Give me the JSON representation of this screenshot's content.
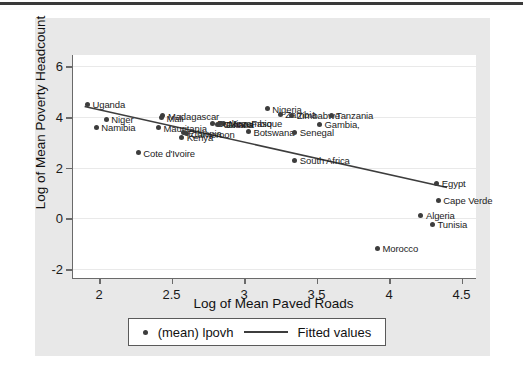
{
  "chart_data": {
    "type": "scatter",
    "title": "",
    "xlabel": "Log of Mean Paved Roads",
    "ylabel": "Log of Mean Poverty Headcount",
    "xlim": [
      1.82,
      4.6
    ],
    "ylim": [
      -2.35,
      6.45
    ],
    "xticks": [
      "2",
      "2.5",
      "3",
      "3.5",
      "4",
      "4.5"
    ],
    "xtick_values": [
      2,
      2.5,
      3,
      3.5,
      4,
      4.5
    ],
    "yticks": [
      "6",
      "4",
      "2",
      "0",
      "-2"
    ],
    "ytick_values": [
      6,
      4,
      2,
      0,
      -2
    ],
    "grid": "horizontal",
    "legend_position": "below-axis",
    "legend": [
      {
        "marker": "dot",
        "label": "(mean) lpovh"
      },
      {
        "marker": "line",
        "label": "Fitted values"
      }
    ],
    "series": [
      {
        "name": "(mean) lpovh",
        "points": [
          {
            "label": "Uganda",
            "x": 1.92,
            "y": 4.5,
            "label_side": "right"
          },
          {
            "label": "Niger",
            "x": 2.05,
            "y": 3.92,
            "label_side": "right"
          },
          {
            "label": "Namibia",
            "x": 1.98,
            "y": 3.6,
            "label_side": "right"
          },
          {
            "label": "Cote d'Ivoire",
            "x": 2.27,
            "y": 2.6,
            "label_side": "right"
          },
          {
            "label": "Madagascar",
            "x": 2.44,
            "y": 4.05,
            "label_side": "right"
          },
          {
            "label": "Mali",
            "x": 2.43,
            "y": 3.98,
            "label_side": "right"
          },
          {
            "label": "Mauritania",
            "x": 2.41,
            "y": 3.58,
            "label_side": "right"
          },
          {
            "label": "Ethiopia",
            "x": 2.58,
            "y": 3.38,
            "label_side": "right"
          },
          {
            "label": "Cameroon",
            "x": 2.6,
            "y": 3.34,
            "label_side": "right"
          },
          {
            "label": "Kenya",
            "x": 2.57,
            "y": 3.2,
            "label_side": "right"
          },
          {
            "label": "Burkina Faso",
            "x": 2.78,
            "y": 3.75,
            "label_side": "right"
          },
          {
            "label": "Mozambique",
            "x": 2.86,
            "y": 3.76,
            "label_side": "right"
          },
          {
            "label": "Ghana",
            "x": 2.84,
            "y": 3.74,
            "label_side": "right"
          },
          {
            "label": "Guinea",
            "x": 2.82,
            "y": 3.72,
            "label_side": "right"
          },
          {
            "label": "Botswana",
            "x": 3.03,
            "y": 3.42,
            "label_side": "right"
          },
          {
            "label": "Nigeria",
            "x": 3.16,
            "y": 4.32,
            "label_side": "right"
          },
          {
            "label": "Zambia",
            "x": 3.25,
            "y": 4.12,
            "label_side": "right"
          },
          {
            "label": "Zimbabwe",
            "x": 3.33,
            "y": 4.08,
            "label_side": "right"
          },
          {
            "label": "Senegal",
            "x": 3.35,
            "y": 3.4,
            "label_side": "right"
          },
          {
            "label": "Tanzania",
            "x": 3.6,
            "y": 4.08,
            "label_side": "right"
          },
          {
            "label": "Gambia,",
            "x": 3.52,
            "y": 3.72,
            "label_side": "right"
          },
          {
            "label": "South Africa",
            "x": 3.35,
            "y": 2.3,
            "label_side": "right"
          },
          {
            "label": "Morocco",
            "x": 3.92,
            "y": -1.18,
            "label_side": "right"
          },
          {
            "label": "Algeria",
            "x": 4.22,
            "y": 0.12,
            "label_side": "right"
          },
          {
            "label": "Tunisia",
            "x": 4.3,
            "y": -0.22,
            "label_side": "right"
          },
          {
            "label": "Egypt",
            "x": 4.33,
            "y": 1.38,
            "label_side": "right"
          },
          {
            "label": "Cape Verde",
            "x": 4.34,
            "y": 0.72,
            "label_side": "right"
          }
        ]
      }
    ],
    "fit_line": {
      "name": "Fitted values",
      "x1": 1.9,
      "y1": 4.42,
      "x2": 4.4,
      "y2": 1.22
    },
    "colors": {
      "marker": "#3d3d3d",
      "line": "#3d3d3d",
      "plot_background": "#ffffff",
      "figure_background": "#e8e8e8",
      "axis": "#6a6a6a",
      "gridline": "#e9e9e9",
      "text": "#1a1a1a"
    }
  }
}
